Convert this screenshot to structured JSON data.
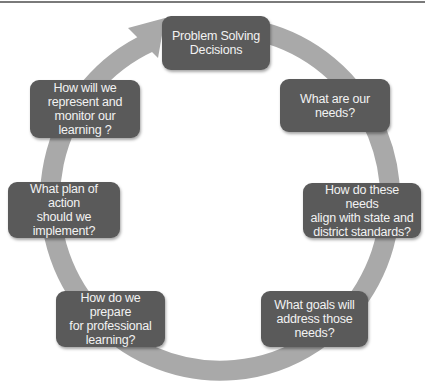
{
  "diagram": {
    "type": "cycle",
    "colors": {
      "node_fill": "#5a5a5a",
      "node_text": "#f2f2f2",
      "ring": "#a9a9a9",
      "background": "#ffffff",
      "top_rule": "#7a7a7a"
    },
    "nodes": [
      {
        "id": "problem-solving",
        "label": "Problem Solving\nDecisions"
      },
      {
        "id": "needs",
        "label": "What are our\nneeds?"
      },
      {
        "id": "align",
        "label": "How do these needs\nalign with state and\ndistrict standards?"
      },
      {
        "id": "goals",
        "label": "What goals will\naddress those\nneeds?"
      },
      {
        "id": "prepare",
        "label": "How do we prepare\nfor professional\nlearning?"
      },
      {
        "id": "plan",
        "label": "What plan of action\nshould we\nimplement?"
      },
      {
        "id": "monitor",
        "label": "How will we\nrepresent and\nmonitor our\nlearning ?"
      }
    ],
    "flow": "clockwise"
  }
}
